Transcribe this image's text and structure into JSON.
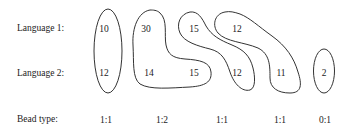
{
  "rows": {
    "language1": "Language 1:",
    "language2": "Language 2:",
    "bead_type": "Bead type:"
  },
  "beads": [
    {
      "l1": [
        "10"
      ],
      "l2": [
        "12"
      ],
      "type": "1:1"
    },
    {
      "l1": [
        "30"
      ],
      "l2": [
        "14",
        "15"
      ],
      "type": "1:2"
    },
    {
      "l1": [
        "15"
      ],
      "l2": [
        "12"
      ],
      "type": "1:1"
    },
    {
      "l1": [
        "12"
      ],
      "l2": [
        "11"
      ],
      "type": "1:1"
    },
    {
      "l1": [],
      "l2": [
        "2"
      ],
      "type": "0:1"
    }
  ],
  "cells": {
    "b1_l1": "10",
    "b1_l2": "12",
    "b2_l1": "30",
    "b2_l2a": "14",
    "b2_l2b": "15",
    "b3_l1": "15",
    "b3_l2": "12",
    "b4_l1": "12",
    "b4_l2": "11",
    "b5_l2": "2"
  },
  "types": [
    "1:1",
    "1:2",
    "1:1",
    "1:1",
    "0:1"
  ],
  "stroke_color": "#333333"
}
